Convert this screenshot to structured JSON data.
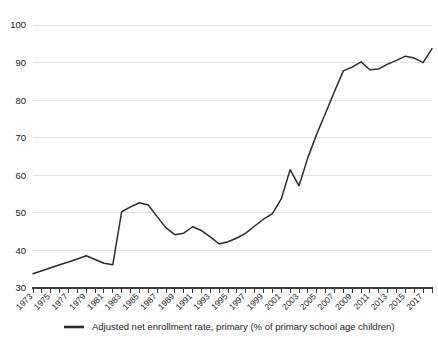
{
  "chart_data": {
    "type": "line",
    "title": "",
    "xlabel": "",
    "ylabel": "",
    "ylim": [
      30,
      100
    ],
    "yticks": [
      30,
      40,
      50,
      60,
      70,
      80,
      90,
      100
    ],
    "grid": true,
    "legend_position": "bottom",
    "x": [
      1973,
      1974,
      1975,
      1976,
      1977,
      1978,
      1979,
      1980,
      1981,
      1982,
      1983,
      1984,
      1985,
      1986,
      1987,
      1988,
      1989,
      1990,
      1991,
      1992,
      1993,
      1994,
      1995,
      1996,
      1997,
      1998,
      1999,
      2000,
      2001,
      2002,
      2003,
      2004,
      2005,
      2006,
      2007,
      2008,
      2009,
      2010,
      2011,
      2012,
      2013,
      2014,
      2015,
      2016,
      2017,
      2018
    ],
    "xtick_labels": [
      "1973",
      "1975",
      "1977",
      "1979",
      "1981",
      "1983",
      "1985",
      "1987",
      "1989",
      "1991",
      "1993",
      "1995",
      "1997",
      "1999",
      "2001",
      "2003",
      "2005",
      "2007",
      "2009",
      "2011",
      "2013",
      "2015",
      "2017"
    ],
    "series": [
      {
        "name": "Adjusted net enrollment rate, primary (% of primary school age children)",
        "color": "#2b2b2b",
        "values": [
          33.8,
          34.6,
          35.4,
          36.2,
          36.9,
          37.7,
          38.6,
          37.6,
          36.6,
          36.2,
          50.3,
          51.6,
          52.7,
          52.1,
          49.0,
          46.0,
          44.2,
          44.6,
          46.3,
          45.3,
          43.6,
          41.7,
          42.3,
          43.3,
          44.6,
          46.5,
          48.3,
          49.8,
          53.7,
          61.5,
          57.2,
          64.7,
          71.0,
          76.6,
          82.3,
          87.8,
          88.8,
          90.2,
          88.1,
          88.3,
          89.6,
          90.6,
          91.7,
          91.2,
          90.0,
          93.7
        ]
      }
    ]
  },
  "legend": {
    "items": [
      {
        "label": "Adjusted net enrollment rate, primary (% of primary school age children)",
        "color": "#2b2b2b"
      }
    ]
  },
  "colors": {
    "line": "#2b2b2b",
    "grid": "#e3e3e3",
    "axis": "#3a3a3a",
    "background": "#ffffff",
    "text": "#1a1a1a"
  }
}
